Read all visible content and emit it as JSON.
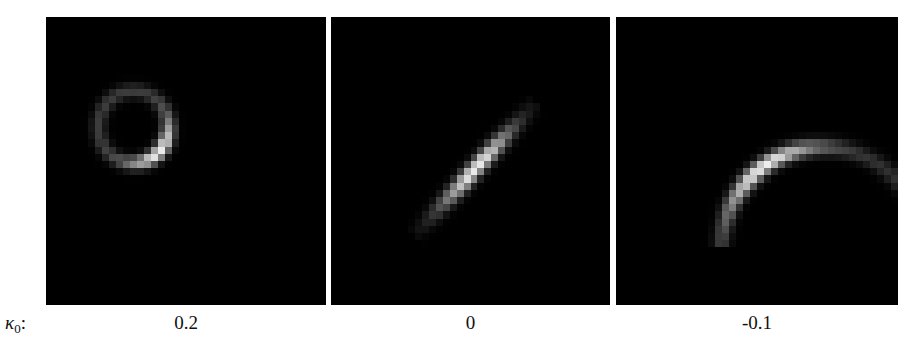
{
  "figure": {
    "row_label": {
      "symbol": "κ",
      "subscript": "0",
      "suffix": ":"
    },
    "panels": [
      {
        "id": "p0",
        "kappa0": "0.2",
        "shape": "near-closed ring (circle), brightest at lower-right",
        "center": [
          0.37,
          0.32
        ],
        "radius": 0.16
      },
      {
        "id": "p1",
        "kappa0": "0",
        "shape": "straight diagonal line segment, lower-left to upper-right",
        "center": [
          0.5,
          0.5
        ]
      },
      {
        "id": "p2",
        "kappa0": "-0.1",
        "shape": "arc curving from bottom up to the right",
        "center": [
          0.6,
          0.5
        ]
      }
    ],
    "colors": {
      "background": "#ffffff",
      "panel": "#000000",
      "intensity_max": "#f0f0f0"
    }
  }
}
